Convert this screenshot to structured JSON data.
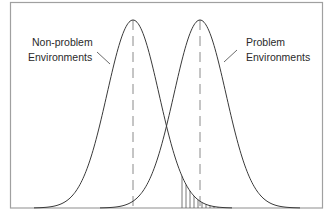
{
  "diagram": {
    "type": "overlapping-distributions",
    "colors": {
      "frame": "#9a9a9a",
      "curve": "#3a3a3a",
      "mean_line": "#8a8a8a",
      "hatch": "#555555",
      "text": "#2a2a2a"
    },
    "curves": [
      {
        "name": "non-problem",
        "label_line1": "Non-problem",
        "label_line2": "Environments",
        "mean_x": 133
      },
      {
        "name": "problem",
        "label_line1": "Problem",
        "label_line2": "Environments",
        "mean_x": 200
      }
    ],
    "shaded_region": "right tail of non-problem curve beyond threshold"
  }
}
